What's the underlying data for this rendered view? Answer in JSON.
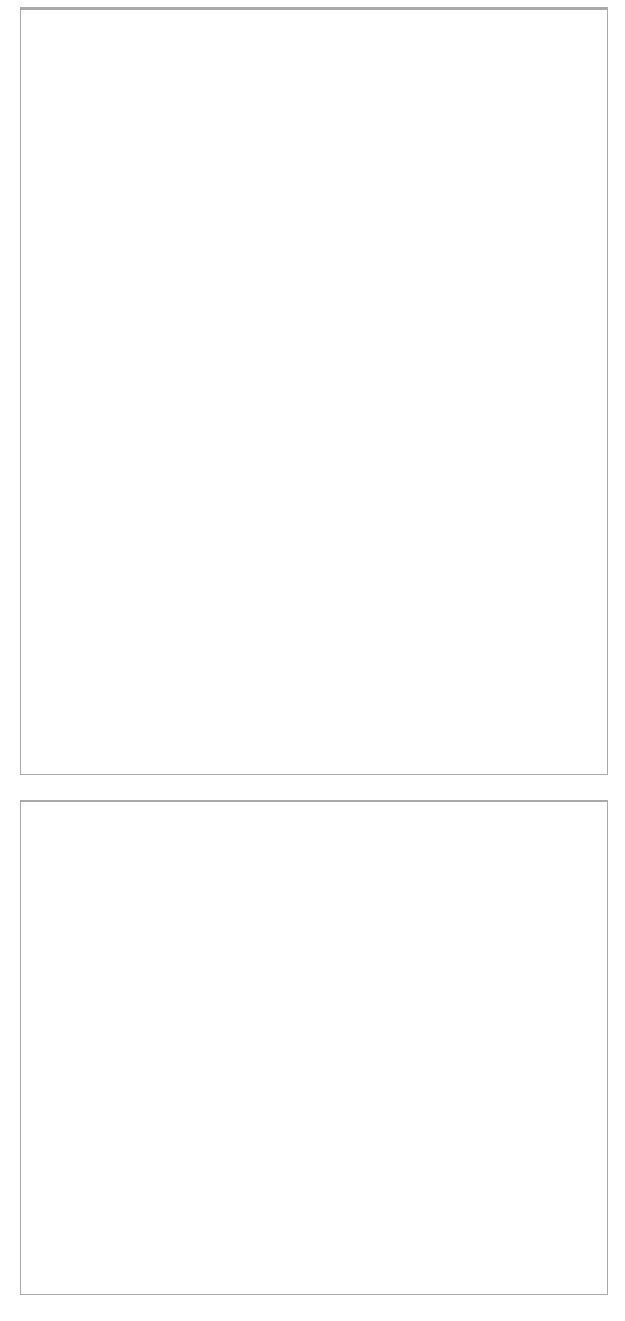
{
  "figure": {
    "kind": "molecular-structure-grid",
    "columns": 2,
    "blocks": [
      {
        "id": "block-top",
        "rows": 3
      },
      {
        "id": "block-bottom",
        "rows": 2
      }
    ]
  },
  "ic50_unit": "nM",
  "ic50_prefix": "IC",
  "ic50_subscript": "50",
  "ic50_equals": "=",
  "compounds": [
    {
      "id": "1",
      "label": "1",
      "ic50_value": "4.4",
      "ic50_text": "IC50=4.4 nM",
      "caption_position": "bottom",
      "variant": "nitro",
      "substituent": "nitrophenyl"
    },
    {
      "id": "2",
      "label": "2",
      "ic50_value": "9.0",
      "ic50_text": "IC50=9.0 nM",
      "caption_position": "bottom",
      "variant": "hydroxy-amine",
      "substituent": "hydroxy-methyl-amine"
    },
    {
      "id": "3",
      "label": "3",
      "ic50_value": "24.0",
      "ic50_text": "IC50=24.0 nM",
      "caption_position": "bottom",
      "variant": "nitro",
      "substituent": "nitrophenyl"
    },
    {
      "id": "4",
      "label": "4",
      "ic50_value": "34.0",
      "ic50_text": "IC50=34.0 nM",
      "caption_position": "top",
      "variant": "phenyl",
      "substituent": "phenyl"
    },
    {
      "id": "25",
      "label": "25",
      "ic50_value": "1420.0",
      "ic50_text": "IC50=1420.0 nM",
      "caption_position": "bottom",
      "variant": "phenyl-small",
      "substituent": "phenyl"
    },
    {
      "id": "26",
      "label": "26",
      "ic50_value": "1460.0",
      "ic50_text": "IC50=1460.0 nM",
      "caption_position": "top",
      "variant": "phenyl",
      "substituent": "phenyl"
    },
    {
      "id": "27",
      "label": "27",
      "ic50_value": "2260.0",
      "ic50_text": "IC50=2260.0 nM",
      "caption_position": "bottom",
      "variant": "phenyl",
      "substituent": "phenyl"
    },
    {
      "id": "28",
      "label": "28",
      "ic50_value": "4200.0",
      "ic50_text": "IC50=4200.0 nM",
      "caption_position": "bottom",
      "variant": "methyl",
      "substituent": "methyl"
    },
    {
      "id": "29",
      "label": "29",
      "ic50_value": "7700.0",
      "ic50_text": "IC50=7700.0 nM",
      "caption_position": "bottom",
      "variant": "chlorophenyl",
      "substituent": "chlorophenyl"
    },
    {
      "id": "30",
      "label": "30",
      "ic50_value": "22900.0",
      "ic50_text": "IC50=22900.0 nM",
      "caption_position": "top",
      "variant": "methyl",
      "substituent": "methyl"
    }
  ],
  "atom_colors": {
    "C": "#9b9b9b",
    "H": "#c9c9c9",
    "N": "#2e2e3a",
    "O": "#5a5a5a",
    "F": "#b5b5b5",
    "Cl": "#3d3d3d",
    "bond": "#c2c2c2",
    "bond_dark": "#a8a8a8"
  },
  "atom_labels": {
    "C": "",
    "H": "H",
    "N": "N",
    "O": "O",
    "F": "F",
    "Cl": "Cl",
    "N_plus": "N",
    "O_minus": "O"
  },
  "charge_marks": {
    "plus": "+",
    "minus": "-"
  }
}
